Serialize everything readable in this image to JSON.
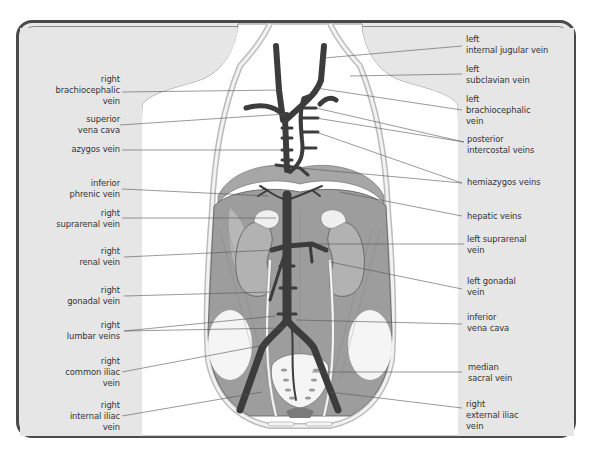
{
  "diagram": {
    "colors": {
      "background": "#e8e8e8",
      "frame": "#4a4a4a",
      "vein": "#3c3c3c",
      "muscle": "#9a9a9a",
      "kidney": "#a8a8a8",
      "body_outline": "#ffffff",
      "text": "#333333"
    },
    "labels_left": [
      {
        "id": "right-brachiocephalic-vein",
        "lines": [
          "right",
          "brachiocephalic",
          "vein"
        ]
      },
      {
        "id": "superior-vena-cava",
        "lines": [
          "superior",
          "vena cava"
        ]
      },
      {
        "id": "azygos-vein",
        "lines": [
          "azygos vein"
        ]
      },
      {
        "id": "inferior-phrenic-vein",
        "lines": [
          "inferior",
          "phrenic vein"
        ]
      },
      {
        "id": "right-suprarenal-vein",
        "lines": [
          "right",
          "suprarenal vein"
        ]
      },
      {
        "id": "right-renal-vein",
        "lines": [
          "right",
          "renal vein"
        ]
      },
      {
        "id": "right-gonadal-vein",
        "lines": [
          "right",
          "gonadal vein"
        ]
      },
      {
        "id": "right-lumbar-veins",
        "lines": [
          "right",
          "lumbar veins"
        ]
      },
      {
        "id": "right-common-iliac-vein",
        "lines": [
          "right",
          "common iliac",
          "vein"
        ]
      },
      {
        "id": "right-internal-iliac-vein",
        "lines": [
          "right",
          "internal iliac",
          "vein"
        ]
      }
    ],
    "labels_right": [
      {
        "id": "left-internal-jugular-vein",
        "lines": [
          "left",
          "internal jugular vein"
        ]
      },
      {
        "id": "left-subclavian-vein",
        "lines": [
          "left",
          "subclavian vein"
        ]
      },
      {
        "id": "left-brachiocephalic-vein",
        "lines": [
          "left",
          "brachiocephalic",
          "vein"
        ]
      },
      {
        "id": "posterior-intercostal-veins",
        "lines": [
          "posterior",
          "intercostal veins"
        ]
      },
      {
        "id": "hemiazygos-veins",
        "lines": [
          "hemiazygos veins"
        ]
      },
      {
        "id": "hepatic-veins",
        "lines": [
          "hepatic veins"
        ]
      },
      {
        "id": "left-suprarenal-vein",
        "lines": [
          "left suprarenal",
          "vein"
        ]
      },
      {
        "id": "left-gonadal-vein",
        "lines": [
          "left gonadal",
          "vein"
        ]
      },
      {
        "id": "inferior-vena-cava",
        "lines": [
          "inferior",
          "vena cava"
        ]
      },
      {
        "id": "median-sacral-vein",
        "lines": [
          "median",
          "sacral vein"
        ]
      },
      {
        "id": "right-external-iliac-vein",
        "lines": [
          "right",
          "external iliac",
          "vein"
        ]
      }
    ]
  }
}
